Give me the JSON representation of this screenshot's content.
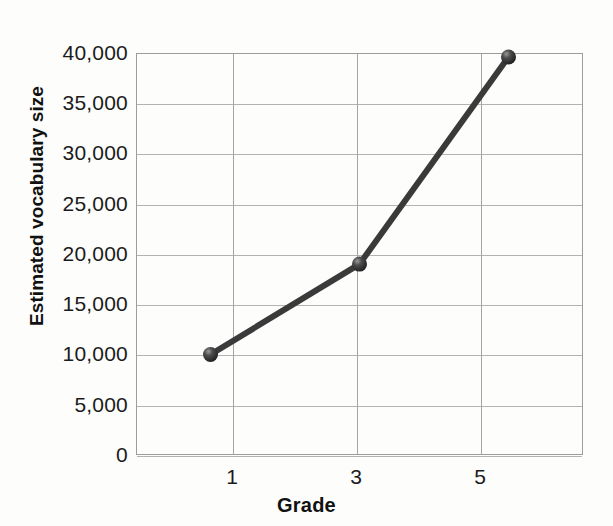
{
  "chart_data": {
    "type": "line",
    "title": "",
    "subtitle": "",
    "xlabel": "Grade",
    "ylabel": "Estimated vocabulary size",
    "x": [
      1,
      3,
      5
    ],
    "categories": [
      "1",
      "3",
      "5"
    ],
    "values": [
      10000,
      19000,
      39600
    ],
    "series": [
      {
        "name": "Estimated vocabulary size",
        "values": [
          10000,
          19000,
          39600
        ]
      }
    ],
    "xlim": [
      0,
      6
    ],
    "ylim": [
      0,
      40000
    ],
    "y_ticks": [
      0,
      5000,
      10000,
      15000,
      20000,
      25000,
      30000,
      35000,
      40000
    ],
    "y_tick_labels": [
      "0",
      "5,000",
      "10,000",
      "15,000",
      "20,000",
      "25,000",
      "30,000",
      "35,000",
      "40,000"
    ],
    "x_ticks": [
      1,
      3,
      5
    ],
    "x_tick_labels": [
      "1",
      "3",
      "5"
    ],
    "grid": "both",
    "legend": "none",
    "annotations": [],
    "colors": {
      "line": "#3a3a3a",
      "marker": "#2e2e2e",
      "marker_highlight": "#8f8f8f",
      "grid": "#b3b3b3",
      "axis": "#9d9d9d",
      "text": "#1b1b1b",
      "background": "#fdfdfc"
    },
    "marker_style": "sphere",
    "line_width": 6
  }
}
